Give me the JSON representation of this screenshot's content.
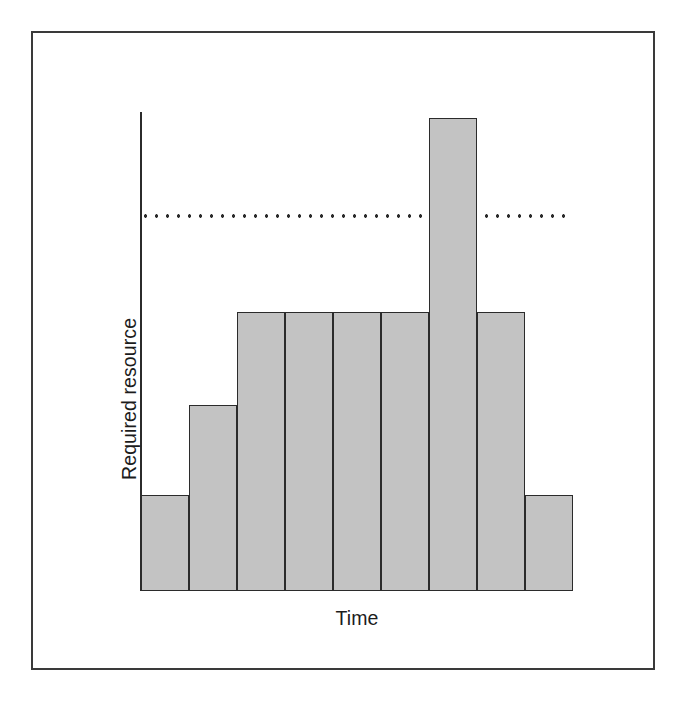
{
  "figure": {
    "kind": "resource-histogram",
    "frame": {
      "border_color": "#3a3a3a"
    },
    "colors": {
      "bar_fill": "#c3c3c3",
      "bar_stroke": "#2b2b2b",
      "axis": "#2b2b2b",
      "threshold": "#2b2b2b",
      "text": "#1c1c1c",
      "background": "#ffffff"
    }
  },
  "chart_data": {
    "type": "bar",
    "title": "",
    "subtitle": "",
    "xlabel": "Time",
    "ylabel": "Required resource",
    "categories": [
      "1",
      "2",
      "3",
      "4",
      "5",
      "6",
      "7",
      "8",
      "9"
    ],
    "values": [
      2,
      4,
      6,
      6,
      6,
      6,
      10,
      6,
      2
    ],
    "ylim": [
      0,
      10.5
    ],
    "xlim": [
      0,
      9
    ],
    "grid": false,
    "legend": null,
    "axis_ticks": {
      "x": [],
      "y": []
    },
    "annotations": [
      {
        "name": "resource-limit",
        "type": "horizontal-threshold-line",
        "style": "dotted",
        "value": 7.85,
        "label": ""
      }
    ]
  },
  "bars": [
    {
      "name": "bar-period-1",
      "x": 141,
      "width": 48,
      "top": 495,
      "value": 2
    },
    {
      "name": "bar-period-2",
      "x": 189,
      "width": 48,
      "top": 405,
      "value": 4
    },
    {
      "name": "bar-period-3",
      "x": 237,
      "width": 48,
      "top": 312,
      "value": 6
    },
    {
      "name": "bar-period-4",
      "x": 285,
      "width": 48,
      "top": 312,
      "value": 6
    },
    {
      "name": "bar-period-5",
      "x": 333,
      "width": 48,
      "top": 312,
      "value": 6
    },
    {
      "name": "bar-period-6",
      "x": 381,
      "width": 48,
      "top": 312,
      "value": 6
    },
    {
      "name": "bar-period-7",
      "x": 429,
      "width": 48,
      "top": 118,
      "value": 10
    },
    {
      "name": "bar-period-8",
      "x": 477,
      "width": 48,
      "top": 312,
      "value": 6
    },
    {
      "name": "bar-period-9",
      "x": 525,
      "width": 48,
      "top": 495,
      "value": 2
    }
  ],
  "geometry": {
    "baseline_y": 591,
    "axis_x": 140,
    "axis_top_y": 112,
    "threshold_y": 216,
    "plot_right_x": 573
  },
  "labels": {
    "y_axis": "Required resource",
    "x_axis": "Time"
  }
}
